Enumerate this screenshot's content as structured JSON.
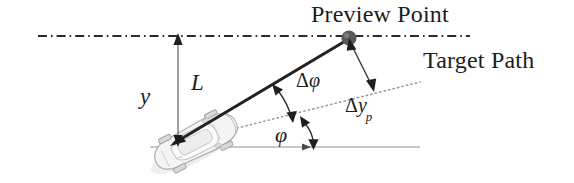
{
  "figure": {
    "title_labels": {
      "preview_point": "Preview Point",
      "target_path": "Target Path"
    },
    "math_labels": {
      "lateral_offset": "y",
      "preview_distance": "L",
      "heading_error_delta": "Δ",
      "heading_error_phi": "φ",
      "preview_offset_delta": "Δ",
      "preview_offset_y": "y",
      "preview_offset_sub": "p",
      "heading_angle": "φ"
    },
    "elements": {
      "vehicle": "car-top-view",
      "preview_point_marker": "filled-circle",
      "target_path_line": "dash-dot-line",
      "heading_line": "dotted-line",
      "reference_line": "solid-horizontal-line",
      "preview_distance_line": "solid-thick-line"
    },
    "colors": {
      "ink": "#1c1c1c",
      "line_dark": "#2b2b2b",
      "line_gray": "#8a8a8a",
      "dotted_gray": "#9a9a9a",
      "car_body": "#f2f2f2",
      "car_outline": "#b9b9b9",
      "point_fill": "#555555",
      "background": "#ffffff"
    },
    "geometry": {
      "preview_point": [
        349,
        39
      ],
      "vehicle_origin": [
        178,
        141
      ],
      "target_path_y": 36,
      "reference_line_y": 147,
      "heading_angle_deg": 14,
      "preview_line_angle_deg": 31
    }
  }
}
